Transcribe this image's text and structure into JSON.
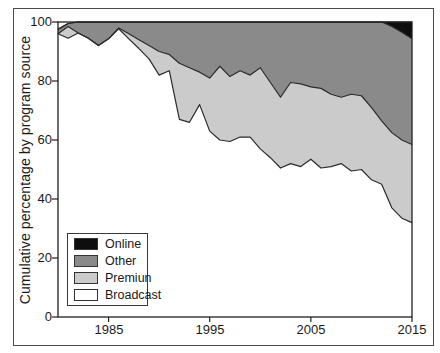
{
  "chart_data": {
    "type": "area",
    "stacked": true,
    "title": "",
    "xlabel": "",
    "ylabel": "Cumulative percentage by program source",
    "ylim": [
      0,
      100
    ],
    "xlim": [
      1980,
      2015
    ],
    "grid": false,
    "legend_position": "lower-left",
    "y_ticks": [
      "0",
      "20",
      "40",
      "60",
      "80",
      "100"
    ],
    "x_ticks": [
      "1985",
      "1995",
      "2005",
      "2015"
    ],
    "x": [
      1980,
      1981,
      1982,
      1983,
      1984,
      1985,
      1986,
      1987,
      1988,
      1989,
      1990,
      1991,
      1992,
      1993,
      1994,
      1995,
      1996,
      1997,
      1998,
      1999,
      2000,
      2001,
      2002,
      2003,
      2004,
      2005,
      2006,
      2007,
      2008,
      2009,
      2010,
      2011,
      2012,
      2013,
      2014,
      2015
    ],
    "series": [
      {
        "name": "Broadcast",
        "color": "#ffffff",
        "values": [
          96,
          94.5,
          96.3,
          94.5,
          92,
          94.3,
          97.7,
          94.3,
          91,
          87.5,
          82,
          83.5,
          67,
          66,
          72,
          63,
          60,
          59.5,
          61,
          61,
          57,
          54,
          50.5,
          52,
          51,
          53.5,
          50.5,
          51,
          52,
          49.5,
          50,
          46.5,
          45,
          37,
          33.5,
          32
        ]
      },
      {
        "name": "Premiun",
        "color": "#cbcbcb",
        "values": [
          0,
          4,
          0,
          0,
          0,
          0,
          0.3,
          1.7,
          3,
          4.5,
          8,
          5.5,
          19,
          18.5,
          11,
          18,
          25,
          22,
          22.5,
          21,
          27.5,
          25.5,
          24,
          27.5,
          28,
          24.5,
          27,
          24.5,
          22.5,
          26,
          25,
          24.5,
          21.5,
          25.5,
          26.5,
          26.5
        ]
      },
      {
        "name": "Other",
        "color": "#8a8a8a",
        "values": [
          1.5,
          1,
          3.7,
          5.5,
          8,
          5.7,
          2,
          4,
          6,
          8,
          10,
          11,
          14,
          15.5,
          17,
          19,
          15,
          18.5,
          16.5,
          18,
          15.5,
          20.5,
          25.5,
          20.5,
          21,
          22,
          22.5,
          24.5,
          25.5,
          24.5,
          25,
          29,
          33.5,
          36,
          36.5,
          35.8
        ]
      },
      {
        "name": "Online",
        "color": "#0e0e0e",
        "values": [
          0,
          0,
          0,
          0,
          0,
          0,
          0,
          0,
          0,
          0,
          0,
          0,
          0,
          0,
          0,
          0,
          0,
          0,
          0,
          0,
          0,
          0,
          0,
          0,
          0,
          0,
          0,
          0,
          0,
          0,
          0,
          0,
          0,
          1.5,
          3.5,
          5.7
        ]
      }
    ]
  },
  "legend": {
    "items": [
      {
        "label": "Online"
      },
      {
        "label": "Other"
      },
      {
        "label": "Premiun"
      },
      {
        "label": "Broadcast"
      }
    ]
  },
  "style": {
    "frame_color": "#1f1f1f",
    "boundary_line_color": "#2b2b2b"
  }
}
